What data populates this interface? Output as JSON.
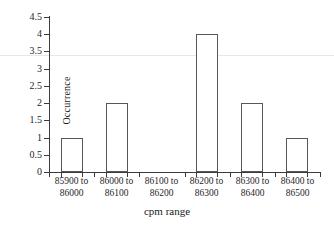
{
  "chart_data": {
    "type": "bar",
    "title": "",
    "xlabel": "cpm range",
    "ylabel": "Occurrence",
    "categories": [
      "85900 to 86000",
      "86000 to 86100",
      "86100 to 86200",
      "86200 to 86300",
      "86300 to 86400",
      "86400 to 86500"
    ],
    "category_lines": [
      {
        "line1": "85900 to",
        "line2": "86000"
      },
      {
        "line1": "86000 to",
        "line2": "86100"
      },
      {
        "line1": "86100 to",
        "line2": "86200"
      },
      {
        "line1": "86200 to",
        "line2": "86300"
      },
      {
        "line1": "86300 to",
        "line2": "86400"
      },
      {
        "line1": "86400 to",
        "line2": "86500"
      }
    ],
    "values": [
      1,
      2,
      0,
      4,
      2,
      1
    ],
    "ylim": [
      0,
      4.5
    ],
    "ytick_labels": [
      "0",
      "0.5",
      "1",
      "1.5",
      "2",
      "2.5",
      "3",
      "3.5",
      "4",
      "4.5"
    ],
    "ytick_values": [
      0,
      0.5,
      1,
      1.5,
      2,
      2.5,
      3,
      3.5,
      4,
      4.5
    ],
    "grid": false,
    "legend": false,
    "legend_position": "none",
    "bar_fill_color": "#ffffff",
    "bar_edge_color": "#575757",
    "axis_color": "#3b3b3b",
    "background_color": "#ffffff"
  }
}
